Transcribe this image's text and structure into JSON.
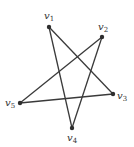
{
  "graph": {
    "vertices": [
      {
        "id": "v1",
        "base": "v",
        "sub": "1"
      },
      {
        "id": "v2",
        "base": "v",
        "sub": "2"
      },
      {
        "id": "v3",
        "base": "v",
        "sub": "3"
      },
      {
        "id": "v4",
        "base": "v",
        "sub": "4"
      },
      {
        "id": "v5",
        "base": "v",
        "sub": "5"
      }
    ],
    "edges": [
      [
        "v1",
        "v3"
      ],
      [
        "v1",
        "v4"
      ],
      [
        "v2",
        "v4"
      ],
      [
        "v2",
        "v5"
      ],
      [
        "v5",
        "v3"
      ]
    ]
  }
}
